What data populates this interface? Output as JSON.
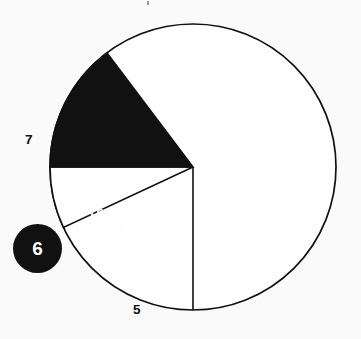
{
  "figure": {
    "name": "doing-triad-pie-diagram",
    "background_color": "#fafafa",
    "ink_color": "#111111",
    "paper_color": "#ffffff"
  },
  "labels": {
    "doing_triad": {
      "line1": "THE DOING",
      "line2": "TRIAD",
      "color": "#111111"
    },
    "disciple": {
      "line1": "The",
      "line2": "Disciple",
      "color": "#ffffff"
    }
  },
  "callouts": {
    "seven": "7",
    "five": "5",
    "six_badge": "6"
  },
  "chart_data": {
    "type": "pie",
    "title": "",
    "subtitle": "",
    "xlabel": "",
    "ylabel": "",
    "legend_position": "none",
    "grid": false,
    "center": {
      "x": 193,
      "y": 167
    },
    "radius": 143,
    "stroke_color": "#111111",
    "stroke_width": 1.6,
    "angles_note": "angles in degrees measured counter-clockwise from 3 o'clock (east)",
    "slices": [
      {
        "name": "THE DOING TRIAD",
        "label": "THE DOING TRIAD",
        "fill": "#ffffff",
        "start_angle": 180,
        "end_angle": 205,
        "sweep": 25,
        "value": 25,
        "callout": "7"
      },
      {
        "name": "The Disciple",
        "label": "The Disciple",
        "fill": "#111111",
        "start_angle": 127,
        "end_angle": 180,
        "sweep": 53,
        "value": 53,
        "callout": "6"
      },
      {
        "name": "remainder",
        "label": "",
        "fill": "#ffffff",
        "start_angle": 205,
        "end_angle": 487,
        "sweep": 282,
        "value": 282,
        "callout": "5"
      }
    ],
    "radial_lines": [
      {
        "name": "upper-left-divider",
        "angle": 205
      },
      {
        "name": "mid-left-divider",
        "angle": 180
      },
      {
        "name": "lower-left-divider",
        "angle": 127
      },
      {
        "name": "bottom-vertical-divider",
        "angle": 270
      }
    ]
  }
}
